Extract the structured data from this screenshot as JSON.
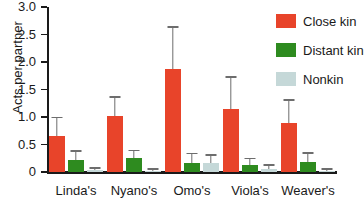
{
  "chart_data": {
    "type": "bar",
    "title": "",
    "xlabel": "",
    "ylabel": "Acts per partner",
    "ylim": [
      0,
      3.0
    ],
    "ytick_labels": [
      "0",
      "0.5",
      "1.0",
      "1.5",
      "2.0",
      "2.5",
      "3.0"
    ],
    "ytick_values": [
      0,
      0.5,
      1.0,
      1.5,
      2.0,
      2.5,
      3.0
    ],
    "grid": false,
    "legend_position": "top-right",
    "categories": [
      "Linda's",
      "Nyano's",
      "Omo's",
      "Viola's",
      "Weaver's"
    ],
    "series": [
      {
        "name": "Close kin",
        "color": "#E8442A",
        "values": [
          0.65,
          1.02,
          1.88,
          1.15,
          0.9
        ],
        "errors_upper": [
          0.98,
          1.35,
          2.62,
          1.71,
          1.3
        ]
      },
      {
        "name": "Distant kin",
        "color": "#2E8B1F",
        "values": [
          0.21,
          0.26,
          0.17,
          0.12,
          0.19
        ],
        "errors_upper": [
          0.37,
          0.38,
          0.32,
          0.23,
          0.33
        ]
      },
      {
        "name": "Nonkin",
        "color": "#C5D8D8",
        "values": [
          0.03,
          0.02,
          0.17,
          0.05,
          0.02
        ],
        "errors_upper": [
          0.06,
          0.04,
          0.3,
          0.11,
          0.04
        ]
      }
    ]
  },
  "legend": {
    "items": [
      {
        "label": "Close kin",
        "color": "#E8442A"
      },
      {
        "label": "Distant kin",
        "color": "#2E8B1F"
      },
      {
        "label": "Nonkin",
        "color": "#C5D8D8"
      }
    ]
  },
  "axis": {
    "y_label": "Acts per partner"
  }
}
